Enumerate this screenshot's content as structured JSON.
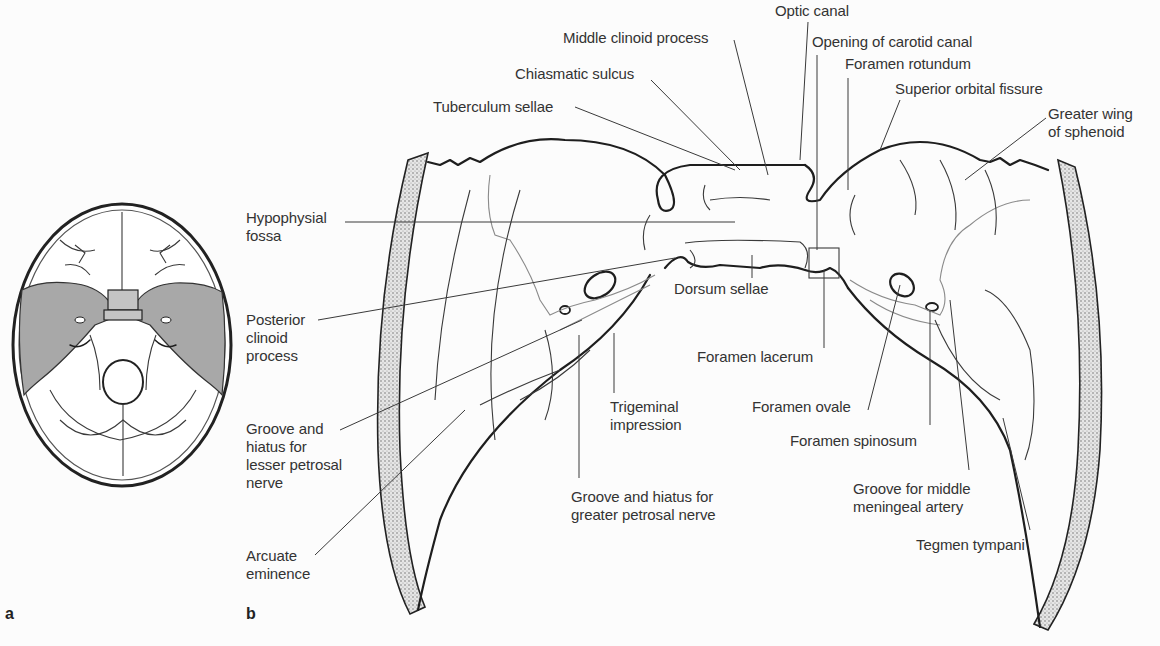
{
  "figure": {
    "panels": [
      {
        "id": "a",
        "label": "a",
        "description": "Inset: superior view of cranial base with middle cranial fossa shaded"
      },
      {
        "id": "b",
        "label": "b",
        "description": "Enlarged middle cranial fossa, sphenoid body and temporal bone"
      }
    ],
    "colors": {
      "background": "#fcfcfc",
      "line": "#1e1e1e",
      "shading": "#a8a8a8",
      "text": "#333333"
    }
  },
  "labels": [
    {
      "id": "optic-canal",
      "text": "Optic canal",
      "x": 775,
      "y": 2,
      "line": [
        [
          808,
          22
        ],
        [
          800,
          160
        ]
      ]
    },
    {
      "id": "middle-clinoid-process",
      "text": "Middle clinoid process",
      "x": 563,
      "y": 29,
      "line": [
        [
          734,
          40
        ],
        [
          768,
          175
        ]
      ]
    },
    {
      "id": "opening-of-carotid-canal",
      "text": "Opening of carotid canal",
      "x": 812,
      "y": 33,
      "line": [
        [
          817,
          55
        ],
        [
          817,
          250
        ]
      ]
    },
    {
      "id": "foramen-rotundum",
      "text": "Foramen rotundum",
      "x": 845,
      "y": 55,
      "line": [
        [
          848,
          78
        ],
        [
          848,
          190
        ]
      ]
    },
    {
      "id": "chiasmatic-sulcus",
      "text": "Chiasmatic sulcus",
      "x": 515,
      "y": 65,
      "line": [
        [
          651,
          80
        ],
        [
          740,
          170
        ]
      ]
    },
    {
      "id": "superior-orbital-fissure",
      "text": "Superior orbital fissure",
      "x": 895,
      "y": 80,
      "line": [
        [
          900,
          100
        ],
        [
          880,
          150
        ]
      ]
    },
    {
      "id": "tuberculum-sellae",
      "text": "Tuberculum sellae",
      "x": 433,
      "y": 98,
      "line": [
        [
          575,
          107
        ],
        [
          735,
          170
        ]
      ]
    },
    {
      "id": "greater-wing-of-sphenoid",
      "text": "Greater wing\nof sphenoid",
      "x": 1048,
      "y": 105,
      "line": [
        [
          1046,
          118
        ],
        [
          965,
          180
        ]
      ]
    },
    {
      "id": "hypophysial-fossa",
      "text": "Hypophysial\nfossa",
      "x": 246,
      "y": 209,
      "line": [
        [
          345,
          222
        ],
        [
          735,
          222
        ]
      ]
    },
    {
      "id": "posterior-clinoid-process",
      "text": "Posterior\nclinoid\nprocess",
      "x": 246,
      "y": 311,
      "line": [
        [
          318,
          320
        ],
        [
          675,
          258
        ]
      ]
    },
    {
      "id": "dorsum-sellae",
      "text": "Dorsum sellae",
      "x": 674,
      "y": 280,
      "line": [
        [
          752,
          278
        ],
        [
          752,
          255
        ]
      ]
    },
    {
      "id": "foramen-lacerum",
      "text": "Foramen lacerum",
      "x": 697,
      "y": 348,
      "line": [
        [
          824,
          348
        ],
        [
          824,
          270
        ]
      ]
    },
    {
      "id": "trigeminal-impression",
      "text": "Trigeminal\nimpression",
      "x": 610,
      "y": 398,
      "line": [
        [
          614,
          393
        ],
        [
          614,
          333
        ]
      ]
    },
    {
      "id": "foramen-ovale",
      "text": "Foramen ovale",
      "x": 752,
      "y": 398,
      "line": [
        [
          868,
          410
        ],
        [
          900,
          285
        ]
      ]
    },
    {
      "id": "groove-hiatus-lesser-petrosal",
      "text": "Groove and\nhiatus for\nlesser petrosal\nnerve",
      "x": 246,
      "y": 420,
      "line": [
        [
          340,
          430
        ],
        [
          582,
          320
        ]
      ]
    },
    {
      "id": "foramen-spinosum",
      "text": "Foramen spinosum",
      "x": 790,
      "y": 432,
      "line": [
        [
          930,
          425
        ],
        [
          930,
          310
        ]
      ]
    },
    {
      "id": "groove-middle-meningeal-artery",
      "text": "Groove for middle\nmeningeal artery",
      "x": 853,
      "y": 480,
      "line": [
        [
          969,
          470
        ],
        [
          950,
          300
        ]
      ]
    },
    {
      "id": "groove-hiatus-greater-petrosal",
      "text": "Groove and hiatus for\ngreater petrosal nerve",
      "x": 571,
      "y": 488,
      "line": [
        [
          579,
          478
        ],
        [
          579,
          335
        ]
      ]
    },
    {
      "id": "arcuate-eminence",
      "text": "Arcuate\neminence",
      "x": 246,
      "y": 547,
      "line": [
        [
          315,
          555
        ],
        [
          465,
          410
        ]
      ]
    },
    {
      "id": "tegmen-tympani",
      "text": "Tegmen tympani",
      "x": 916,
      "y": 536,
      "line": [
        [
          1030,
          530
        ],
        [
          1003,
          418
        ]
      ]
    }
  ]
}
